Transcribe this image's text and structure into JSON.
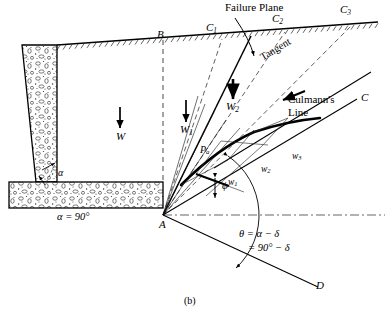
{
  "figure": {
    "caption": "(b)",
    "title_context": "Culmann's graphical method for active earth pressure on a retaining wall"
  },
  "labels": {
    "failure_plane": "Failure Plane",
    "tangent": "Tangent",
    "culmanns_line_1": "Culmann's",
    "culmanns_line_2": "Line",
    "point_B": "B",
    "point_A": "A",
    "point_C": "C",
    "point_D": "D",
    "surface_C1": "C",
    "surface_C1_sub": "1",
    "surface_C2": "C",
    "surface_C2_sub": "2",
    "surface_C3": "C",
    "surface_C3_sub": "3",
    "weight_W": "W",
    "weight_W1": "W",
    "weight_W1_sub": "1",
    "weight_W2": "W",
    "weight_W2_sub": "2",
    "force_w1": "w",
    "force_w1_sub": "1",
    "force_w2": "w",
    "force_w2_sub": "2",
    "force_w3": "w",
    "force_w3_sub": "3",
    "pressure_Pa": "P",
    "pressure_Pa_sub": "a",
    "angle_alpha": "α",
    "angle_alpha_value": "α = 90°",
    "angle_phi": "ϕ",
    "theta_eq_1": "θ = α − δ",
    "theta_eq_2": "= 90° − δ"
  },
  "colors": {
    "ink": "#000000",
    "dash": "#555555",
    "thin": "#333333",
    "fill_concrete": "#ffffff"
  },
  "geometry": {
    "point_A": [
      163,
      215
    ],
    "ground_left": [
      57,
      45
    ],
    "ground_right": [
      378,
      22
    ],
    "wall_top_left": [
      22,
      45
    ],
    "footing_top": 182,
    "footing_bottom": 208,
    "culmann_C_end": [
      360,
      96
    ],
    "line_D_end": [
      318,
      287
    ],
    "fan_rays": 5
  }
}
